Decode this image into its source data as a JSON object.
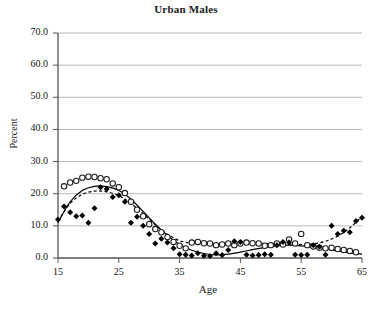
{
  "chart_data": {
    "type": "scatter",
    "title": "Urban Males",
    "xlabel": "Age",
    "ylabel": "Percent",
    "xlim": [
      15,
      65
    ],
    "ylim": [
      0,
      70
    ],
    "grid": true,
    "legend": "none",
    "xticks": [
      "15",
      "25",
      "35",
      "45",
      "55",
      "65"
    ],
    "xtick_values": [
      15,
      25,
      35,
      45,
      55,
      65
    ],
    "yticks": [
      "0.0",
      "10.0",
      "20.0",
      "30.0",
      "40.0",
      "50.0",
      "60.0",
      "70.0"
    ],
    "ytick_values": [
      0,
      10,
      20,
      30,
      40,
      50,
      60,
      70
    ],
    "series": [
      {
        "name": "open-circles",
        "marker": "open-circle",
        "color": "#1a1a1a",
        "x": [
          16,
          17,
          18,
          19,
          20,
          21,
          22,
          23,
          24,
          25,
          26,
          27,
          28,
          29,
          30,
          31,
          32,
          33,
          34,
          35,
          36,
          37,
          38,
          39,
          40,
          41,
          42,
          43,
          44,
          45,
          46,
          47,
          48,
          49,
          50,
          51,
          52,
          53,
          54,
          55,
          56,
          57,
          58,
          59,
          60,
          61,
          62,
          63,
          64
        ],
        "y": [
          22.3,
          23.5,
          24.0,
          25.0,
          25.3,
          25.2,
          24.8,
          24.5,
          23.2,
          22.0,
          20.2,
          17.5,
          15.0,
          13.0,
          10.5,
          9.0,
          8.0,
          6.5,
          5.0,
          3.8,
          3.0,
          4.8,
          5.0,
          4.6,
          4.5,
          4.0,
          4.2,
          4.5,
          4.0,
          4.5,
          4.8,
          4.6,
          4.5,
          3.8,
          4.0,
          4.5,
          4.2,
          5.8,
          4.5,
          7.5,
          4.0,
          3.6,
          3.2,
          3.0,
          3.2,
          2.8,
          2.5,
          2.2,
          1.8
        ]
      },
      {
        "name": "filled-diamonds",
        "marker": "filled-diamond",
        "color": "#000000",
        "x": [
          15,
          16,
          17,
          18,
          19,
          20,
          21,
          22,
          23,
          24,
          25,
          26,
          27,
          28,
          29,
          30,
          31,
          32,
          33,
          34,
          35,
          36,
          37,
          38,
          39,
          40,
          41,
          42,
          43,
          44,
          45,
          46,
          47,
          48,
          49,
          50,
          51,
          52,
          53,
          54,
          55,
          56,
          57,
          58,
          59,
          60,
          61,
          62,
          63,
          64,
          65
        ],
        "y": [
          12.0,
          16.0,
          14.2,
          13.0,
          13.2,
          11.0,
          15.5,
          22.0,
          21.5,
          19.0,
          19.5,
          17.5,
          11.0,
          12.8,
          10.0,
          7.5,
          4.5,
          6.0,
          4.8,
          3.0,
          1.2,
          1.0,
          0.8,
          1.5,
          0.7,
          0.6,
          1.5,
          0.9,
          2.5,
          5.2,
          5.0,
          1.0,
          0.8,
          0.9,
          1.2,
          1.0,
          4.0,
          5.0,
          4.8,
          1.0,
          0.9,
          1.0,
          4.0,
          3.5,
          1.0,
          10.0,
          7.5,
          8.5,
          8.0,
          11.5,
          12.5
        ]
      }
    ],
    "fitted_curves": [
      {
        "name": "solid-fit",
        "style": "solid",
        "color": "#000000",
        "x": [
          15,
          17,
          19,
          21,
          23,
          25,
          27,
          29,
          31,
          33,
          35,
          37,
          39,
          41,
          43,
          45,
          47,
          49,
          51,
          53,
          55,
          57,
          59,
          61,
          63,
          65
        ],
        "y": [
          11.0,
          17.5,
          21.0,
          22.3,
          22.2,
          21.0,
          18.3,
          14.5,
          10.5,
          7.0,
          4.2,
          2.4,
          1.4,
          1.0,
          1.2,
          1.8,
          2.6,
          3.3,
          3.8,
          4.0,
          3.8,
          3.4,
          2.8,
          2.2,
          1.6,
          1.2
        ]
      },
      {
        "name": "dashed-fit",
        "style": "dashed",
        "color": "#000000",
        "x": [
          15,
          17,
          19,
          21,
          23,
          25,
          27,
          29,
          31,
          33,
          35,
          37,
          39,
          41,
          43,
          45,
          47,
          49,
          51,
          53,
          55,
          57,
          59,
          61,
          63,
          65
        ],
        "y": [
          11.5,
          17.0,
          19.8,
          20.8,
          20.6,
          19.4,
          17.0,
          13.8,
          10.3,
          7.4,
          5.4,
          4.6,
          4.4,
          4.4,
          4.5,
          4.6,
          4.6,
          4.5,
          4.4,
          4.3,
          4.2,
          4.4,
          5.2,
          6.8,
          9.4,
          13.0
        ]
      }
    ]
  }
}
